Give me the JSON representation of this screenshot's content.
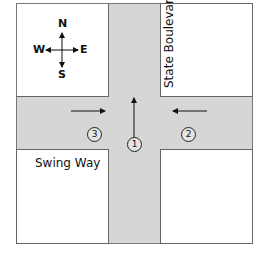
{
  "streets": {
    "vertical": "State Boulevard",
    "horizontal": "Swing Way"
  },
  "compass": {
    "n": "N",
    "s": "S",
    "e": "E",
    "w": "W"
  },
  "vehicles": [
    {
      "id": "1",
      "direction": "north"
    },
    {
      "id": "2",
      "direction": "west"
    },
    {
      "id": "3",
      "direction": "east"
    }
  ],
  "colors": {
    "road": "#d6d6d6",
    "block": "#ffffff",
    "line": "#222222"
  }
}
